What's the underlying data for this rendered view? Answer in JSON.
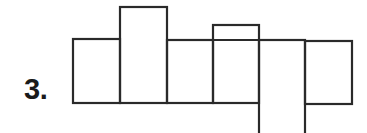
{
  "diagram": {
    "label": "3.",
    "type": "cube-net",
    "stroke_color": "#2a2a2a",
    "faces": [
      {
        "name": "face-1",
        "x": 73,
        "y": 39,
        "w": 47,
        "h": 64
      },
      {
        "name": "face-2",
        "x": 120,
        "y": 7,
        "w": 47,
        "h": 96
      },
      {
        "name": "face-3",
        "x": 167,
        "y": 40,
        "w": 46,
        "h": 63
      },
      {
        "name": "face-4",
        "x": 213,
        "y": 25,
        "w": 46,
        "h": 78
      },
      {
        "name": "face-5",
        "x": 259,
        "y": 40,
        "w": 46,
        "h": 100
      },
      {
        "name": "face-6",
        "x": 305,
        "y": 41,
        "w": 47,
        "h": 63
      }
    ],
    "inner_lines": [
      {
        "name": "face-4-divider",
        "x1": 213,
        "y1": 40,
        "x2": 259,
        "y2": 40
      }
    ]
  }
}
